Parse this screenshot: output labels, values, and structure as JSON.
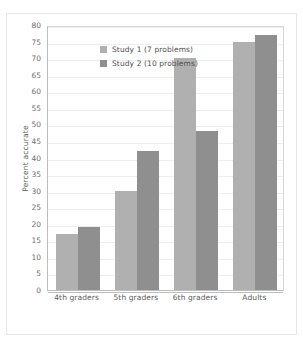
{
  "page_artifact": {
    "left_fragment": "",
    "right_fragment": ""
  },
  "chart_data": {
    "type": "bar",
    "title": "",
    "subtitle": "",
    "xlabel": "",
    "ylabel": "Percent accurate",
    "categories": [
      "4th graders",
      "5th graders",
      "6th graders",
      "Adults"
    ],
    "series": [
      {
        "name": "Study 1 (7 problems)",
        "values": [
          17,
          30,
          70,
          75
        ],
        "color": "#b0b0b0"
      },
      {
        "name": "Study 2 (10 problems)",
        "values": [
          19,
          42,
          48,
          77
        ],
        "color": "#8f8f8f"
      }
    ],
    "ylim": [
      0,
      80
    ],
    "ytick_step": 5,
    "yticks": [
      0,
      5,
      10,
      15,
      20,
      25,
      30,
      35,
      40,
      45,
      50,
      55,
      60,
      65,
      70,
      75,
      80
    ],
    "ytick_labels": [
      "0",
      "5",
      "10",
      "15",
      "20",
      "25",
      "30",
      "35",
      "40",
      "45",
      "50",
      "55",
      "60",
      "65",
      "70",
      "75",
      "80"
    ],
    "grid": true,
    "grid_axis": "y",
    "legend_position": "top-left-inside",
    "legend_entries": [
      "Study 1 (7 problems)",
      "Study 2 (10 problems)"
    ],
    "annotations": []
  }
}
